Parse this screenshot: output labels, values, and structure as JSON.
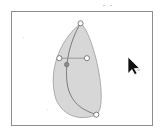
{
  "app": {
    "title": "Vector Path Editor",
    "canvas_label": "drawing-canvas"
  },
  "canvas": {
    "background_color": "#ffffff",
    "frame_border_color": "#8d8d8d",
    "frame": {
      "x": 11,
      "y": 11,
      "width": 142,
      "height": 115
    }
  },
  "shape": {
    "name": "crescent-leaf-path",
    "fill_color": "#c9c9c9",
    "fill_opacity": 0.75,
    "stroke_color": "#9a9a9a",
    "stroke_width": 0.8,
    "outline_path": "M 69.5 11.5 C 46.5 30.5 36.5 62.5 44.5 88.5 C 52.5 108.5 72.5 110.5 85.5 104.5 C 94.0 99.0 90.5 66.0 84.0 43.0 C 79.0 25.0 74.0 15.0 69.5 11.5 Z"
  },
  "spine": {
    "name": "bezier-spine-curve",
    "stroke_color": "#6f6f6f",
    "stroke_width": 0.9,
    "path": "M 69.5 11.5 C 58.5 30.0 52.5 55.0 56.5 76.0 C 61.0 95.0 74.0 100.5 85.5 104.5"
  },
  "handle_line": {
    "name": "control-handle-line",
    "stroke_color": "#8a8a8a",
    "stroke_width": 0.8,
    "x1": 48.0,
    "y1": 47.0,
    "x2": 76.0,
    "y2": 47.0
  },
  "nodes": [
    {
      "id": "node-top-anchor",
      "label": "top anchor node",
      "x": 69.5,
      "y": 11.5,
      "type": "anchor",
      "radius": 2.6
    },
    {
      "id": "node-bottom-anchor",
      "label": "bottom anchor node",
      "x": 85.5,
      "y": 104.5,
      "type": "anchor",
      "radius": 2.6
    },
    {
      "id": "node-left-handle",
      "label": "left control handle",
      "x": 48.0,
      "y": 47.0,
      "type": "handle",
      "radius": 2.6
    },
    {
      "id": "node-right-handle",
      "label": "right control handle",
      "x": 76.0,
      "y": 47.0,
      "type": "handle",
      "radius": 2.6
    },
    {
      "id": "node-mid-anchor",
      "label": "mid anchor node",
      "x": 55.5,
      "y": 53.5,
      "type": "selected",
      "radius": 2.2
    }
  ],
  "node_style": {
    "stroke_color": "#6f6f6f",
    "fill_color": "#ffffff",
    "selected_fill_color": "#8f8f8f",
    "stroke_width": 0.9
  },
  "cursor": {
    "name": "arrow-pointer",
    "x": 128,
    "y": 57,
    "fill_color": "#111111",
    "outline_color": "#ffffff"
  },
  "specks": [
    {
      "x": 103,
      "y": 5,
      "w": 2,
      "h": 1,
      "color": "#c9c9c9"
    },
    {
      "x": 110,
      "y": 5,
      "w": 2,
      "h": 1,
      "color": "#cccccc"
    },
    {
      "x": 23,
      "y": 37,
      "w": 1,
      "h": 1,
      "color": "#dedede"
    },
    {
      "x": 47,
      "y": 109,
      "w": 1,
      "h": 1,
      "color": "#e0e0e0"
    },
    {
      "x": 137,
      "y": 69,
      "w": 3,
      "h": 2,
      "color": "#d7d7d7"
    }
  ]
}
